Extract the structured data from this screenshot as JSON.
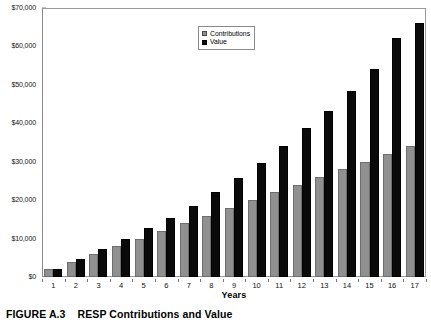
{
  "caption": {
    "number": "FIGURE A.3",
    "title": "RESP Contributions and Value"
  },
  "legend": {
    "position": "top-center",
    "items": [
      {
        "label": "Contributions",
        "color": "#909090",
        "swatch": "contributions-swatch"
      },
      {
        "label": "Value",
        "color": "#0a0a0a",
        "swatch": "value-swatch"
      }
    ]
  },
  "axes": {
    "x_title": "Years",
    "y_title": "",
    "y_tick_labels": [
      "$0",
      "$10,000",
      "$20,000",
      "$30,000",
      "$40,000",
      "$50,000",
      "$60,000",
      "$70,000"
    ],
    "x_tick_labels": [
      "1",
      "2",
      "3",
      "4",
      "5",
      "6",
      "7",
      "8",
      "9",
      "10",
      "11",
      "12",
      "13",
      "14",
      "15",
      "16",
      "17"
    ]
  },
  "colors": {
    "contributions": "#909090",
    "value": "#0a0a0a",
    "frame": "#9a9a9a",
    "background": "#ffffff"
  },
  "chart_data": {
    "type": "bar",
    "title": "RESP Contributions and Value",
    "xlabel": "Years",
    "ylabel": "",
    "ylim": [
      0,
      70000
    ],
    "ytick_values": [
      0,
      10000,
      20000,
      30000,
      40000,
      50000,
      60000,
      70000
    ],
    "ytick_labels": [
      "$0",
      "$10,000",
      "$20,000",
      "$30,000",
      "$40,000",
      "$50,000",
      "$60,000",
      "$70,000"
    ],
    "grid": false,
    "legend_position": "top-center",
    "categories": [
      "1",
      "2",
      "3",
      "4",
      "5",
      "6",
      "7",
      "8",
      "9",
      "10",
      "11",
      "12",
      "13",
      "14",
      "15",
      "16",
      "17"
    ],
    "series": [
      {
        "name": "Contributions",
        "color": "#909090",
        "values": [
          2000,
          4000,
          6000,
          8000,
          10000,
          12000,
          14000,
          16000,
          18000,
          20000,
          22000,
          24000,
          26000,
          28000,
          30000,
          32000,
          34000
        ]
      },
      {
        "name": "Value",
        "color": "#0a0a0a",
        "values": [
          2200,
          4600,
          7200,
          9900,
          12800,
          15300,
          18600,
          22000,
          25700,
          29700,
          34000,
          38700,
          43200,
          48500,
          54100,
          62200,
          66200
        ]
      }
    ]
  }
}
